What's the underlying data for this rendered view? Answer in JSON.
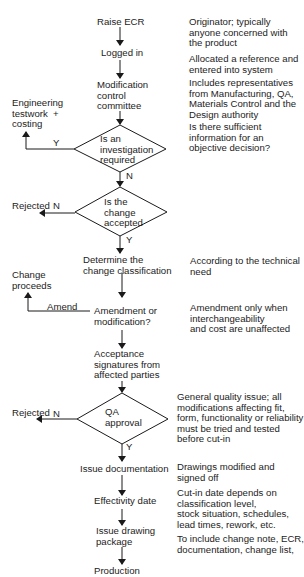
{
  "flowchart": {
    "steps": {
      "raise_ecr": "Raise ECR",
      "logged_in": "Logged in",
      "mod_committee": "Modification\ncontrol\ncommittee",
      "investigation_decision": "Is an\ninvestigation\nrequired",
      "engineering": "Engineering\ntestwork  +\ncosting",
      "change_accepted_decision": "Is the\nchange\naccepted",
      "rejected_1": "Rejected",
      "determine_class": "Determine the\nchange classification",
      "change_proceeds": "Change\nproceeds",
      "amend_or_mod": "Amendment or\nmodification?",
      "acceptance_sigs": "Acceptance\nsignatures from\naffected parties",
      "qa_decision": "QA\napproval",
      "rejected_2": "Rejected",
      "issue_docs": "Issue documentation",
      "effectivity": "Effectivity date",
      "issue_package": "Issue drawing\npackage",
      "production": "Production"
    },
    "branch_labels": {
      "investigation_yes": "Y",
      "investigation_no": "N",
      "accepted_no": "N",
      "accepted_yes": "Y",
      "amend": "Amend",
      "qa_no": "N",
      "qa_yes": "Y"
    },
    "notes": {
      "raise_ecr": "Originator; typically\nanyone concerned with\nthe product",
      "logged_in": "Allocated a reference and\nentered into system",
      "mod_committee": "Includes representatives\nfrom Manufacturing, QA,\nMaterials Control and the\nDesign authority",
      "investigation": "Is there sufficient\ninformation for an\nobjective decision?",
      "determine_class": "According to the technical\nneed",
      "amend_or_mod": "Amendment only when\ninterchangeability\nand cost are unaffected",
      "qa": "General quality issue; all\nmodifications affecting fit,\nform, functionality or reliability\nmust be tried and tested\nbefore cut-in",
      "issue_docs": "Drawings modified and\nsigned off",
      "effectivity": "Cut-in date depends on\nclassification level,\nstock situation, schedules,\nlead times, rework, etc.",
      "issue_package": "To include change note, ECR,\ndocumentation, change list,"
    }
  }
}
